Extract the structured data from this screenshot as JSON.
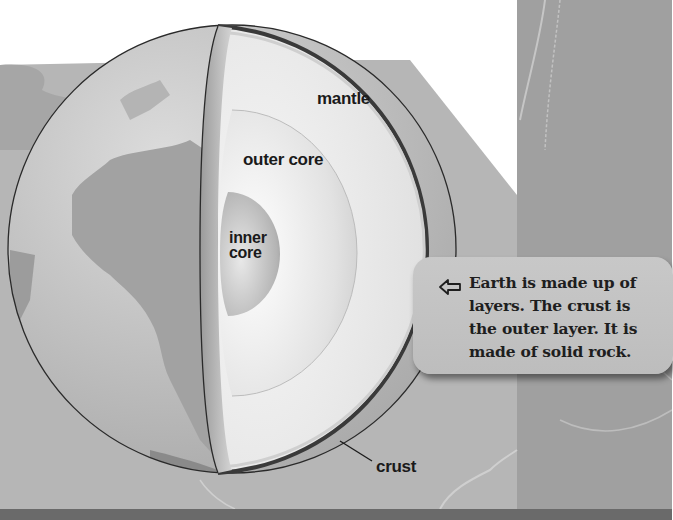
{
  "diagram": {
    "labels": {
      "mantle": "mantle",
      "outer_core": "outer core",
      "inner_core_line1": "inner",
      "inner_core_line2": "core",
      "crust": "crust"
    },
    "callout": {
      "icon": "arrow-left-icon",
      "lines": [
        "Earth is made up of",
        "layers. The crust is",
        "the outer layer. It is",
        "made of solid rock."
      ]
    },
    "colors": {
      "background_white": "#ffffff",
      "panel_gray": "#b4b4b4",
      "right_band_gray": "#9e9e9e",
      "bottom_strip": "#6e6e6e",
      "globe_ocean": "#c4c4c4",
      "globe_land": "#a4a4a4",
      "mantle": "#e6e6e6",
      "outer_core": "#d8d8d8",
      "inner_core": "#b8b8b8",
      "crust_outline": "#222222",
      "callout_bg": "#c4c4c4",
      "text": "#1a1a1a"
    }
  }
}
